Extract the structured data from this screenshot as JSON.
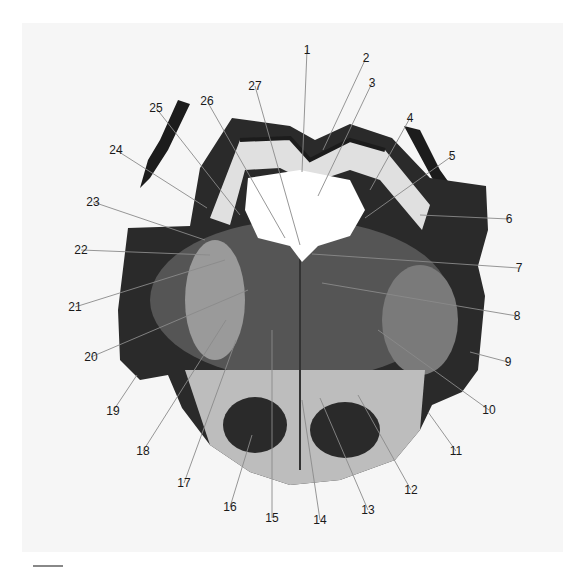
{
  "figure": {
    "type": "anatomical cross-section with numbered labels",
    "background_color": "#f6f6f6",
    "tissue_dark": "#1c1c1c",
    "tissue_mid": "#6a6a6a",
    "tissue_light": "#d8d8d8",
    "ventricle_color": "#ffffff"
  },
  "labels": [
    {
      "id": "1",
      "x": 307,
      "y": 50,
      "tx": 302,
      "ty": 172
    },
    {
      "id": "2",
      "x": 366,
      "y": 58,
      "tx": 323,
      "ty": 150
    },
    {
      "id": "3",
      "x": 372,
      "y": 83,
      "tx": 318,
      "ty": 196
    },
    {
      "id": "4",
      "x": 410,
      "y": 118,
      "tx": 370,
      "ty": 190
    },
    {
      "id": "5",
      "x": 452,
      "y": 156,
      "tx": 365,
      "ty": 218
    },
    {
      "id": "6",
      "x": 509,
      "y": 219,
      "tx": 420,
      "ty": 215
    },
    {
      "id": "7",
      "x": 519,
      "y": 268,
      "tx": 312,
      "ty": 254
    },
    {
      "id": "8",
      "x": 517,
      "y": 316,
      "tx": 322,
      "ty": 283
    },
    {
      "id": "9",
      "x": 508,
      "y": 362,
      "tx": 470,
      "ty": 352
    },
    {
      "id": "10",
      "x": 489,
      "y": 410,
      "tx": 378,
      "ty": 330
    },
    {
      "id": "11",
      "x": 456,
      "y": 451,
      "tx": 428,
      "ty": 412
    },
    {
      "id": "12",
      "x": 411,
      "y": 490,
      "tx": 358,
      "ty": 395
    },
    {
      "id": "13",
      "x": 368,
      "y": 510,
      "tx": 320,
      "ty": 398
    },
    {
      "id": "14",
      "x": 320,
      "y": 520,
      "tx": 302,
      "ty": 400
    },
    {
      "id": "15",
      "x": 272,
      "y": 518,
      "tx": 272,
      "ty": 330
    },
    {
      "id": "16",
      "x": 230,
      "y": 507,
      "tx": 252,
      "ty": 435
    },
    {
      "id": "17",
      "x": 184,
      "y": 483,
      "tx": 236,
      "ty": 340
    },
    {
      "id": "18",
      "x": 143,
      "y": 451,
      "tx": 226,
      "ty": 320
    },
    {
      "id": "19",
      "x": 113,
      "y": 411,
      "tx": 137,
      "ty": 375
    },
    {
      "id": "20",
      "x": 91,
      "y": 357,
      "tx": 248,
      "ty": 290
    },
    {
      "id": "21",
      "x": 75,
      "y": 307,
      "tx": 225,
      "ty": 260
    },
    {
      "id": "22",
      "x": 81,
      "y": 250,
      "tx": 210,
      "ty": 255
    },
    {
      "id": "23",
      "x": 93,
      "y": 202,
      "tx": 205,
      "ty": 240
    },
    {
      "id": "24",
      "x": 116,
      "y": 150,
      "tx": 207,
      "ty": 208
    },
    {
      "id": "25",
      "x": 156,
      "y": 108,
      "tx": 240,
      "ty": 215
    },
    {
      "id": "26",
      "x": 207,
      "y": 101,
      "tx": 285,
      "ty": 238
    },
    {
      "id": "27",
      "x": 255,
      "y": 86,
      "tx": 300,
      "ty": 245
    }
  ],
  "scale_bar": {
    "visible": true
  }
}
